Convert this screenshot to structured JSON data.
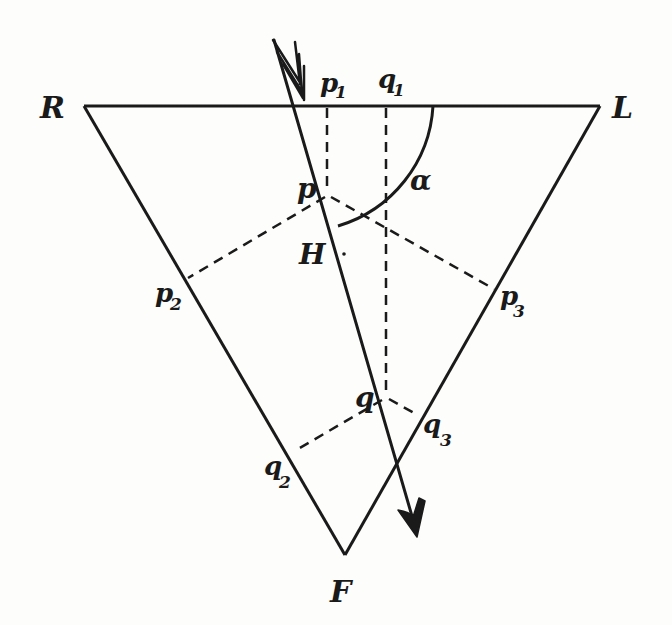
{
  "diagram": {
    "type": "prism-ray-construction",
    "background": "#fdfdfb",
    "ink": "#1a1a1a",
    "vertices": {
      "R": {
        "label": "R",
        "x": 84,
        "y": 106
      },
      "L": {
        "label": "L",
        "x": 600,
        "y": 106
      },
      "F": {
        "label": "F",
        "x": 345,
        "y": 555
      }
    },
    "ray": {
      "start": [
        272,
        38
      ],
      "entry": [
        300,
        106
      ],
      "end": [
        417,
        535
      ],
      "arrow": "arrowhead at end, fletched tail at start"
    },
    "points": {
      "p": {
        "label": "p",
        "x": 328,
        "y": 195
      },
      "q": {
        "label": "q",
        "x": 385,
        "y": 395
      },
      "H": {
        "label": "H"
      }
    },
    "projections": {
      "p1": {
        "label": "p",
        "sub": "1"
      },
      "q1": {
        "label": "q",
        "sub": "1"
      },
      "p2": {
        "label": "p",
        "sub": "2"
      },
      "p3": {
        "label": "p",
        "sub": "3"
      },
      "q2": {
        "label": "q",
        "sub": "2"
      },
      "q3": {
        "label": "q",
        "sub": "3"
      }
    },
    "angle": {
      "label": "α"
    }
  }
}
